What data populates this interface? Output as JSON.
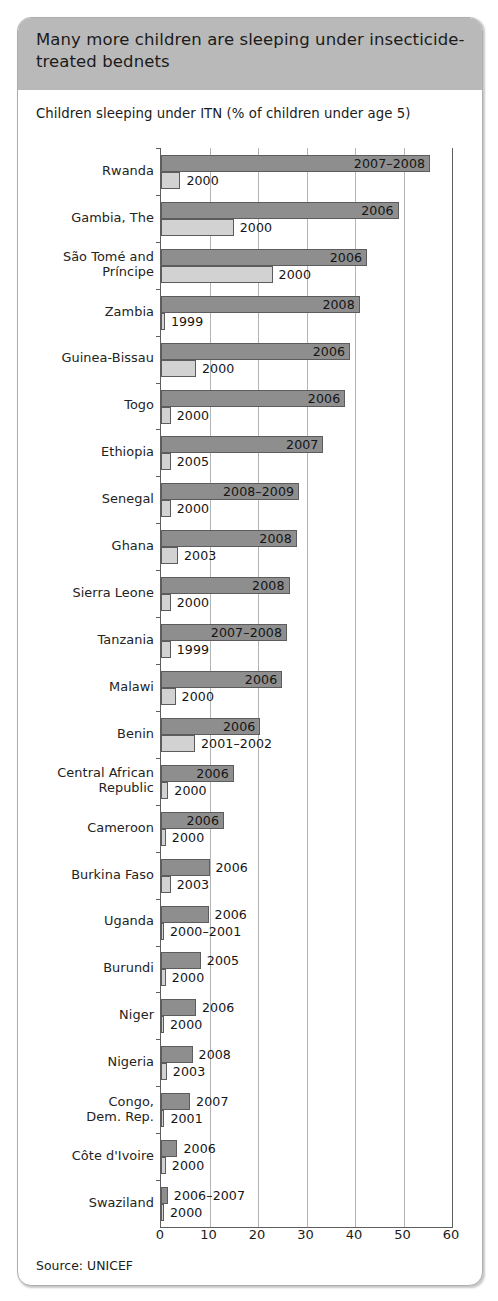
{
  "figure": {
    "title": "Many more children are sleeping under insecticide-treated bednets",
    "subtitle": "Children sleeping under ITN (% of children under age 5)",
    "source": "Source: UNICEF"
  },
  "colors": {
    "header_band": "#b9b9b9",
    "recent_bar": "#8e8e8e",
    "earlier_bar": "#d2d2d2",
    "axis": "#5e5e5e",
    "gridline": "#b4b4b4",
    "panel_border": "#aeaeae"
  },
  "chart_data": {
    "type": "bar",
    "orientation": "horizontal",
    "title": "Many more children are sleeping under insecticide-treated bednets",
    "subtitle": "Children sleeping under ITN (% of children under age 5)",
    "xlabel": "",
    "ylabel": "",
    "xlim": [
      0,
      60
    ],
    "xticks": [
      0,
      10,
      20,
      30,
      40,
      50,
      60
    ],
    "grid": true,
    "legend": "none",
    "source": "Source: UNICEF",
    "series": [
      {
        "name": "Recent survey",
        "color": "#8e8e8e",
        "values": [
          55.5,
          49.0,
          42.5,
          41.0,
          39.0,
          38.0,
          33.5,
          28.5,
          28.0,
          26.5,
          26.0,
          25.0,
          20.5,
          15.0,
          13.0,
          10.0,
          9.8,
          8.2,
          7.2,
          6.5,
          6.0,
          3.4,
          1.4
        ]
      },
      {
        "name": "Earlier survey",
        "color": "#d2d2d2",
        "values": [
          4.0,
          15.0,
          23.0,
          0.8,
          7.2,
          2.0,
          2.0,
          2.0,
          3.5,
          2.0,
          2.0,
          3.0,
          7.0,
          1.5,
          1.0,
          2.0,
          0.2,
          1.0,
          0.6,
          1.2,
          0.7,
          1.0,
          0.3
        ]
      }
    ],
    "categories": [
      "Rwanda",
      "Gambia, The",
      "São Tomé and Príncipe",
      "Zambia",
      "Guinea-Bissau",
      "Togo",
      "Ethiopia",
      "Senegal",
      "Ghana",
      "Sierra Leone",
      "Tanzania",
      "Malawi",
      "Benin",
      "Central African Republic",
      "Cameroon",
      "Burkina Faso",
      "Uganda",
      "Burundi",
      "Niger",
      "Nigeria",
      "Congo, Dem. Rep.",
      "Côte d'Ivoire",
      "Swaziland"
    ]
  },
  "rows": [
    {
      "label": "Rwanda",
      "label_lines": "Rwanda",
      "recent": 55.5,
      "recent_year": "2007–2008",
      "recent_label_inside": true,
      "earlier": 4.0,
      "earlier_year": "2000"
    },
    {
      "label": "Gambia, The",
      "label_lines": "Gambia, The",
      "recent": 49.0,
      "recent_year": "2006",
      "recent_label_inside": true,
      "earlier": 15.0,
      "earlier_year": "2000"
    },
    {
      "label": "São Tomé and Príncipe",
      "label_lines": "São Tomé and\nPríncipe",
      "recent": 42.5,
      "recent_year": "2006",
      "recent_label_inside": true,
      "earlier": 23.0,
      "earlier_year": "2000"
    },
    {
      "label": "Zambia",
      "label_lines": "Zambia",
      "recent": 41.0,
      "recent_year": "2008",
      "recent_label_inside": true,
      "earlier": 0.8,
      "earlier_year": "1999"
    },
    {
      "label": "Guinea-Bissau",
      "label_lines": "Guinea-Bissau",
      "recent": 39.0,
      "recent_year": "2006",
      "recent_label_inside": true,
      "earlier": 7.2,
      "earlier_year": "2000"
    },
    {
      "label": "Togo",
      "label_lines": "Togo",
      "recent": 38.0,
      "recent_year": "2006",
      "recent_label_inside": true,
      "earlier": 2.0,
      "earlier_year": "2000"
    },
    {
      "label": "Ethiopia",
      "label_lines": "Ethiopia",
      "recent": 33.5,
      "recent_year": "2007",
      "recent_label_inside": true,
      "earlier": 2.0,
      "earlier_year": "2005"
    },
    {
      "label": "Senegal",
      "label_lines": "Senegal",
      "recent": 28.5,
      "recent_year": "2008–2009",
      "recent_label_inside": true,
      "earlier": 2.0,
      "earlier_year": "2000"
    },
    {
      "label": "Ghana",
      "label_lines": "Ghana",
      "recent": 28.0,
      "recent_year": "2008",
      "recent_label_inside": true,
      "earlier": 3.5,
      "earlier_year": "2003"
    },
    {
      "label": "Sierra Leone",
      "label_lines": "Sierra Leone",
      "recent": 26.5,
      "recent_year": "2008",
      "recent_label_inside": true,
      "earlier": 2.0,
      "earlier_year": "2000"
    },
    {
      "label": "Tanzania",
      "label_lines": "Tanzania",
      "recent": 26.0,
      "recent_year": "2007–2008",
      "recent_label_inside": true,
      "earlier": 2.0,
      "earlier_year": "1999"
    },
    {
      "label": "Malawi",
      "label_lines": "Malawi",
      "recent": 25.0,
      "recent_year": "2006",
      "recent_label_inside": true,
      "earlier": 3.0,
      "earlier_year": "2000"
    },
    {
      "label": "Benin",
      "label_lines": "Benin",
      "recent": 20.5,
      "recent_year": "2006",
      "recent_label_inside": true,
      "earlier": 7.0,
      "earlier_year": "2001–2002"
    },
    {
      "label": "Central African Republic",
      "label_lines": "Central African\nRepublic",
      "recent": 15.0,
      "recent_year": "2006",
      "recent_label_inside": true,
      "earlier": 1.5,
      "earlier_year": "2000"
    },
    {
      "label": "Cameroon",
      "label_lines": "Cameroon",
      "recent": 13.0,
      "recent_year": "2006",
      "recent_label_inside": true,
      "earlier": 1.0,
      "earlier_year": "2000"
    },
    {
      "label": "Burkina Faso",
      "label_lines": "Burkina Faso",
      "recent": 10.0,
      "recent_year": "2006",
      "recent_label_inside": false,
      "earlier": 2.0,
      "earlier_year": "2003"
    },
    {
      "label": "Uganda",
      "label_lines": "Uganda",
      "recent": 9.8,
      "recent_year": "2006",
      "recent_label_inside": false,
      "earlier": 0.2,
      "earlier_year": "2000–2001"
    },
    {
      "label": "Burundi",
      "label_lines": "Burundi",
      "recent": 8.2,
      "recent_year": "2005",
      "recent_label_inside": false,
      "earlier": 1.0,
      "earlier_year": "2000"
    },
    {
      "label": "Niger",
      "label_lines": "Niger",
      "recent": 7.2,
      "recent_year": "2006",
      "recent_label_inside": false,
      "earlier": 0.6,
      "earlier_year": "2000"
    },
    {
      "label": "Nigeria",
      "label_lines": "Nigeria",
      "recent": 6.5,
      "recent_year": "2008",
      "recent_label_inside": false,
      "earlier": 1.2,
      "earlier_year": "2003"
    },
    {
      "label": "Congo, Dem. Rep.",
      "label_lines": "Congo,\nDem. Rep.",
      "recent": 6.0,
      "recent_year": "2007",
      "recent_label_inside": false,
      "earlier": 0.7,
      "earlier_year": "2001"
    },
    {
      "label": "Côte d'Ivoire",
      "label_lines": "Côte d'Ivoire",
      "recent": 3.4,
      "recent_year": "2006",
      "recent_label_inside": false,
      "earlier": 1.0,
      "earlier_year": "2000"
    },
    {
      "label": "Swaziland",
      "label_lines": "Swaziland",
      "recent": 1.4,
      "recent_year": "2006–2007",
      "recent_label_inside": false,
      "earlier": 0.3,
      "earlier_year": "2000"
    }
  ],
  "axis": {
    "ticks": [
      "0",
      "10",
      "20",
      "30",
      "40",
      "50",
      "60"
    ],
    "values": [
      0,
      10,
      20,
      30,
      40,
      50,
      60
    ]
  }
}
